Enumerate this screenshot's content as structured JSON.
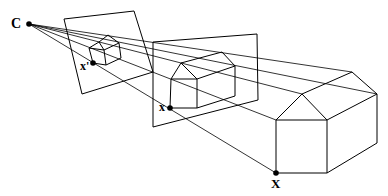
{
  "diagram": {
    "labels": {
      "camera_center": "C",
      "image_point_small": "x'",
      "image_point_medium": "x",
      "world_point": "X"
    },
    "colors": {
      "line": "#000000",
      "background": "#ffffff"
    }
  }
}
